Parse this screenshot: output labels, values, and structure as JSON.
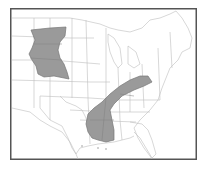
{
  "map": {
    "subject": "Contiguous United States with state boundaries",
    "frame_color": "#555555",
    "border_color": "#b8b8b8",
    "shade_color": "#9a9a9a",
    "shade_outline": "#777777",
    "shaded_regions": [
      {
        "id": "great-plains",
        "description": "Central Great Plains region (South Dakota, Nebraska, Kansas)"
      },
      {
        "id": "appalachian-gulf",
        "description": "Band from Ohio/Kentucky along Appalachians into Tennessee, Mississippi and Alabama"
      }
    ]
  }
}
